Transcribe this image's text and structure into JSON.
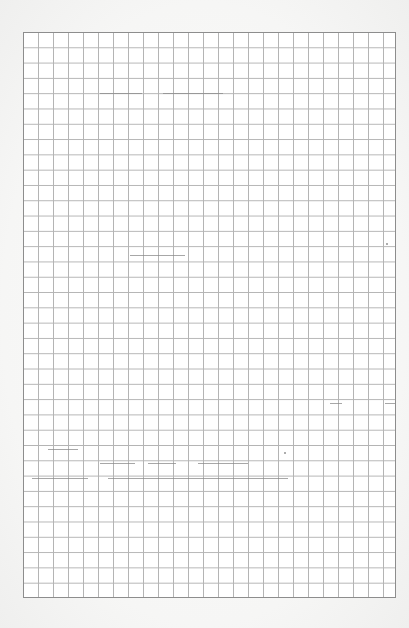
{
  "document": {
    "type": "graph-paper-sheet",
    "grid": {
      "columns": 25,
      "rows": 37,
      "line_color": "#b4b4b4",
      "border_color": "#8d8d8d",
      "paper_color": "#ffffff",
      "background_color": "#f4f4f3"
    },
    "text": []
  }
}
